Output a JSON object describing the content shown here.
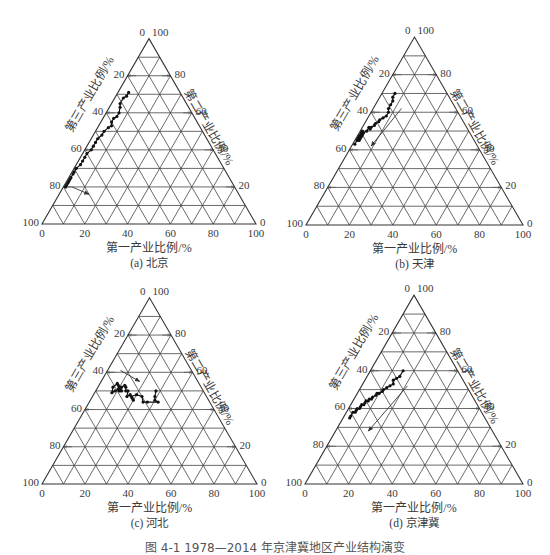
{
  "figure": {
    "caption": "图 4-1  1978—2014 年京津冀地区产业结构演变"
  },
  "axes": {
    "bottom_label": "第一产业比例/%",
    "left_label": "第三产业比例/%",
    "right_label": "第二产业比例/%",
    "bottom_ticks": [
      "0",
      "20",
      "40",
      "60",
      "80",
      "100"
    ],
    "left_ticks": [
      "0",
      "20",
      "40",
      "60",
      "80",
      "100"
    ],
    "right_ticks": [
      "100",
      "80",
      "60",
      "40",
      "20",
      "0"
    ]
  },
  "panels": [
    {
      "id": "a",
      "subtitle": "(a) 北京"
    },
    {
      "id": "b",
      "subtitle": "(b) 天津"
    },
    {
      "id": "c",
      "subtitle": "(c) 河北"
    },
    {
      "id": "d",
      "subtitle": "(d) 京津冀"
    }
  ],
  "chart_data": [
    {
      "type": "scatter",
      "subtype": "ternary-trajectory",
      "title": "(a) 北京",
      "axes": {
        "a": "第一产业比例/%",
        "b": "第二产业比例/%",
        "c": "第三产业比例/%"
      },
      "grid": true,
      "ticks": [
        0,
        20,
        40,
        60,
        80,
        100
      ],
      "series": [
        {
          "name": "北京 1978—2014",
          "points_primary_secondary_tertiary": [
            [
              5,
              71,
              24
            ],
            [
              5,
              69,
              26
            ],
            [
              4,
              68,
              28
            ],
            [
              4,
              65,
              31
            ],
            [
              5,
              63,
              32
            ],
            [
              6,
              60,
              34
            ],
            [
              6,
              58,
              36
            ],
            [
              5,
              57,
              38
            ],
            [
              5,
              55,
              40
            ],
            [
              6,
              53,
              41
            ],
            [
              5,
              52,
              43
            ],
            [
              4,
              50,
              46
            ],
            [
              4,
              48,
              48
            ],
            [
              3,
              46,
              51
            ],
            [
              3,
              44,
              53
            ],
            [
              3,
              42,
              55
            ],
            [
              3,
              40,
              57
            ],
            [
              2,
              38,
              60
            ],
            [
              2,
              36,
              62
            ],
            [
              2,
              34,
              64
            ],
            [
              2,
              32,
              66
            ],
            [
              1,
              30,
              69
            ],
            [
              1,
              28,
              71
            ],
            [
              1,
              27,
              72
            ],
            [
              1,
              25,
              74
            ],
            [
              1,
              24,
              75
            ],
            [
              1,
              23,
              76
            ],
            [
              1,
              22,
              77
            ],
            [
              1,
              21,
              78
            ],
            [
              1,
              20,
              79
            ]
          ],
          "arrow": {
            "from": [
              4,
              20,
              76
            ],
            "to": [
              14,
              16,
              70
            ]
          }
        }
      ]
    },
    {
      "type": "scatter",
      "subtype": "ternary-trajectory",
      "title": "(b) 天津",
      "grid": true,
      "ticks": [
        0,
        20,
        40,
        60,
        80,
        100
      ],
      "series": [
        {
          "name": "天津 1978—2014",
          "points_primary_secondary_tertiary": [
            [
              6,
              70,
              24
            ],
            [
              6,
              68,
              26
            ],
            [
              7,
              66,
              27
            ],
            [
              7,
              64,
              29
            ],
            [
              7,
              62,
              31
            ],
            [
              8,
              60,
              32
            ],
            [
              8,
              58,
              34
            ],
            [
              7,
              57,
              36
            ],
            [
              6,
              56,
              38
            ],
            [
              6,
              55,
              39
            ],
            [
              5,
              54,
              41
            ],
            [
              5,
              53,
              42
            ],
            [
              4,
              52,
              44
            ],
            [
              4,
              51,
              45
            ],
            [
              3,
              52,
              45
            ],
            [
              3,
              50,
              47
            ],
            [
              2,
              49,
              49
            ],
            [
              2,
              48,
              50
            ],
            [
              2,
              47,
              51
            ],
            [
              2,
              46,
              52
            ],
            [
              2,
              45,
              53
            ],
            [
              1,
              46,
              53
            ],
            [
              1,
              47,
              52
            ],
            [
              1,
              49,
              50
            ],
            [
              1,
              50,
              49
            ],
            [
              1,
              48,
              51
            ],
            [
              1,
              47,
              52
            ],
            [
              1,
              46,
              53
            ],
            [
              1,
              45,
              54
            ],
            [
              1,
              43,
              56
            ]
          ],
          "arrow": {
            "from": [
              13,
              62,
              25
            ],
            "to": [
              9,
              42,
              49
            ]
          }
        }
      ]
    },
    {
      "type": "scatter",
      "subtype": "ternary-trajectory",
      "title": "(c) 河北",
      "grid": true,
      "ticks": [
        0,
        20,
        40,
        60,
        80,
        100
      ],
      "series": [
        {
          "name": "河北 1978—2014",
          "points_primary_secondary_tertiary": [
            [
              28,
              50,
              22
            ],
            [
              29,
              47,
              24
            ],
            [
              30,
              45,
              25
            ],
            [
              32,
              44,
              24
            ],
            [
              27,
              44,
              29
            ],
            [
              25,
              44,
              31
            ],
            [
              23,
              47,
              30
            ],
            [
              20,
              48,
              32
            ],
            [
              18,
              47,
              35
            ],
            [
              19,
              46,
              35
            ],
            [
              20,
              45,
              35
            ],
            [
              17,
              48,
              35
            ],
            [
              16,
              47,
              37
            ],
            [
              15,
              50,
              35
            ],
            [
              14,
              50,
              36
            ],
            [
              13,
              52,
              35
            ],
            [
              12,
              53,
              35
            ],
            [
              11,
              52,
              37
            ],
            [
              11,
              50,
              39
            ],
            [
              10,
              51,
              39
            ],
            [
              9,
              50,
              41
            ],
            [
              8,
              49,
              43
            ],
            [
              7,
              52,
              41
            ],
            [
              8,
              54,
              38
            ],
            [
              9,
              53,
              38
            ],
            [
              10,
              52,
              38
            ],
            [
              11,
              51,
              38
            ],
            [
              12,
              50,
              38
            ]
          ],
          "arrow": {
            "from": [
              6,
              61,
              33
            ],
            "to": [
              18,
              55,
              27
            ]
          }
        }
      ]
    },
    {
      "type": "scatter",
      "subtype": "ternary-trajectory",
      "title": "(d) 京津冀",
      "grid": true,
      "ticks": [
        0,
        20,
        40,
        60,
        80,
        100
      ],
      "series": [
        {
          "name": "京津冀 1978—2014",
          "points_primary_secondary_tertiary": [
            [
              15,
              60,
              25
            ],
            [
              15,
              57,
              28
            ],
            [
              14,
              56,
              30
            ],
            [
              13,
              55,
              32
            ],
            [
              14,
              53,
              33
            ],
            [
              13,
              52,
              35
            ],
            [
              12,
              51,
              37
            ],
            [
              11,
              50,
              39
            ],
            [
              11,
              49,
              40
            ],
            [
              10,
              48,
              42
            ],
            [
              9,
              48,
              43
            ],
            [
              9,
              47,
              44
            ],
            [
              8,
              46,
              46
            ],
            [
              8,
              45,
              47
            ],
            [
              7,
              45,
              48
            ],
            [
              7,
              44,
              49
            ],
            [
              6,
              44,
              50
            ],
            [
              6,
              43,
              51
            ],
            [
              6,
              42,
              52
            ],
            [
              5,
              42,
              53
            ],
            [
              5,
              41,
              54
            ],
            [
              5,
              40,
              55
            ],
            [
              4,
              40,
              56
            ],
            [
              4,
              39,
              57
            ],
            [
              4,
              38,
              58
            ],
            [
              3,
              38,
              59
            ],
            [
              3,
              36,
              61
            ],
            [
              3,
              35,
              62
            ]
          ],
          "arrow": {
            "from": [
              21,
              52,
              27
            ],
            "to": [
              15,
              28,
              57
            ]
          }
        }
      ]
    }
  ]
}
